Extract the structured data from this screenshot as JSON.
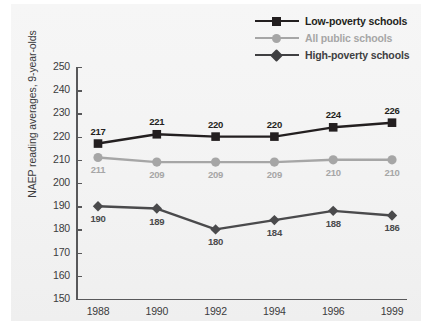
{
  "chart_data": {
    "type": "line",
    "title": "",
    "xlabel": "",
    "ylabel": "NAEP reading averages, 9-year-olds",
    "categories": [
      "1988",
      "1990",
      "1992",
      "1994",
      "1996",
      "1999"
    ],
    "ylim": [
      150,
      250
    ],
    "yticks": [
      150,
      160,
      170,
      180,
      190,
      200,
      210,
      220,
      230,
      240,
      250
    ],
    "grid": false,
    "legend_position": "top-right",
    "series": [
      {
        "name": "Low-poverty schools",
        "marker": "square",
        "color": "#231f20",
        "values": [
          217,
          221,
          220,
          220,
          224,
          226
        ],
        "label_position": "above"
      },
      {
        "name": "All public schools",
        "marker": "circle",
        "color": "#a6a6a6",
        "values": [
          211,
          209,
          209,
          209,
          210,
          210
        ],
        "label_position": "below"
      },
      {
        "name": "High-poverty schools",
        "marker": "diamond",
        "color": "#4a4a4c",
        "values": [
          190,
          189,
          180,
          184,
          188,
          186
        ],
        "label_position": "below"
      }
    ]
  },
  "legend": {
    "items": [
      {
        "label": "Low-poverty schools",
        "color": "#231f20",
        "marker": "square"
      },
      {
        "label": "All public schools",
        "color": "#a6a6a6",
        "marker": "circle"
      },
      {
        "label": "High-poverty schools",
        "color": "#404042",
        "marker": "diamond"
      }
    ]
  },
  "axes": {
    "y_title": "NAEP reading averages, 9-year-olds",
    "y_tick_labels": [
      "250",
      "240",
      "230",
      "220",
      "210",
      "200",
      "190",
      "180",
      "170",
      "160",
      "150"
    ],
    "x_tick_labels": [
      "1988",
      "1990",
      "1992",
      "1994",
      "1996",
      "1999"
    ],
    "axis_color": "#58585a"
  },
  "colors": {
    "panel_background": "#f4f4f4",
    "page_background": "#ffffff",
    "text": "#3b3b3d"
  }
}
